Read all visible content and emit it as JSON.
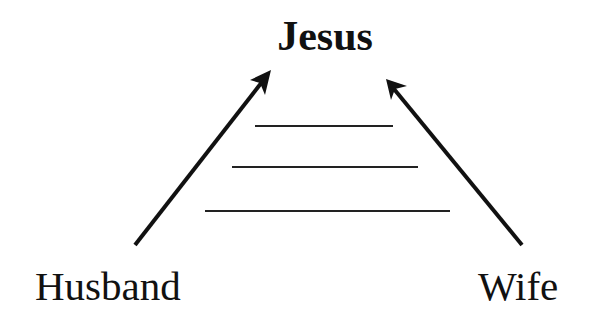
{
  "diagram": {
    "title": "Jesus",
    "left_label": "Husband",
    "right_label": "Wife",
    "arrows": [
      {
        "from": "Husband",
        "to": "Jesus"
      },
      {
        "from": "Wife",
        "to": "Jesus"
      }
    ],
    "rungs": 3,
    "colors": {
      "ink": "#111111",
      "background": "#ffffff"
    }
  }
}
